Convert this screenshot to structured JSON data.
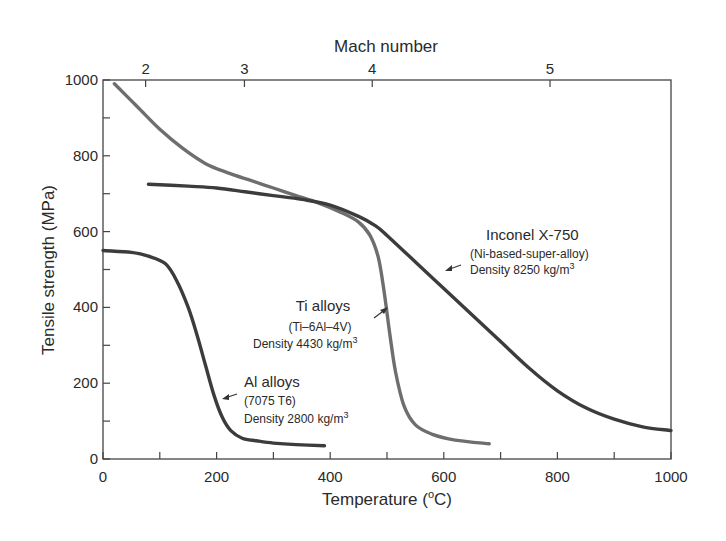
{
  "chart_data": {
    "type": "line",
    "title": "",
    "xlabel": "Temperature (°C)",
    "xlabel_main": "Temperature (",
    "xlabel_sup": "o",
    "xlabel_end": "C)",
    "ylabel": "Tensile strength (MPa)",
    "top_xlabel": "Mach number",
    "xlim": [
      0,
      1000
    ],
    "ylim": [
      0,
      1000
    ],
    "x_ticks": [
      0,
      200,
      400,
      600,
      800,
      1000
    ],
    "x_minor_ticks": [
      100,
      300,
      500,
      700,
      900
    ],
    "y_ticks": [
      0,
      200,
      400,
      600,
      800,
      1000
    ],
    "y_minor_ticks": [
      100,
      300,
      500,
      700,
      900
    ],
    "top_ticks": [
      {
        "label": "2",
        "temperature": 75
      },
      {
        "label": "3",
        "temperature": 249
      },
      {
        "label": "4",
        "temperature": 474
      },
      {
        "label": "5",
        "temperature": 787
      }
    ],
    "grid": false,
    "series": [
      {
        "name": "Ti alloys",
        "subtitle": "(Ti–6Al–4V)",
        "density": "Density 4430 kg/m",
        "density_sup": "3",
        "color": "#6e6e6e",
        "x": [
          20,
          60,
          100,
          140,
          180,
          220,
          260,
          300,
          340,
          380,
          420,
          450,
          470,
          485,
          495,
          505,
          515,
          530,
          550,
          580,
          620,
          680
        ],
        "y": [
          990,
          930,
          870,
          820,
          780,
          755,
          735,
          715,
          695,
          675,
          650,
          625,
          590,
          530,
          440,
          330,
          230,
          140,
          90,
          65,
          50,
          40
        ]
      },
      {
        "name": "Inconel X-750",
        "subtitle": "(Ni-based-super-alloy)",
        "density": "Density 8250 kg/m",
        "density_sup": "3",
        "color": "#3c3c3c",
        "x": [
          80,
          150,
          200,
          250,
          300,
          350,
          400,
          450,
          480,
          500,
          550,
          600,
          650,
          700,
          750,
          800,
          850,
          900,
          950,
          1000
        ],
        "y": [
          725,
          720,
          715,
          705,
          695,
          685,
          670,
          640,
          615,
          590,
          520,
          450,
          380,
          310,
          240,
          180,
          135,
          105,
          85,
          75
        ]
      },
      {
        "name": "Al alloys",
        "subtitle": "(7075 T6)",
        "density": "Density 2800 kg/m",
        "density_sup": "3",
        "color": "#3c3c3c",
        "x": [
          0,
          50,
          80,
          110,
          130,
          150,
          165,
          180,
          195,
          210,
          225,
          245,
          270,
          300,
          340,
          390
        ],
        "y": [
          550,
          545,
          535,
          515,
          470,
          400,
          330,
          250,
          170,
          110,
          75,
          55,
          48,
          42,
          38,
          35
        ]
      }
    ]
  }
}
